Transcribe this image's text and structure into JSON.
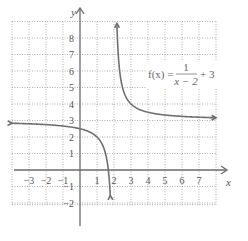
{
  "chart_data": {
    "type": "line",
    "title": "",
    "xlabel": "x",
    "ylabel": "y",
    "xlim": [
      -4,
      8
    ],
    "ylim": [
      -2.5,
      9
    ],
    "grid": true,
    "x_ticks": [
      -3,
      -2,
      -1,
      1,
      2,
      3,
      4,
      5,
      6,
      7
    ],
    "x_tick_labels": [
      "−3",
      "−2",
      "−1",
      "1",
      "2",
      "3",
      "4",
      "5",
      "6",
      "7"
    ],
    "y_ticks": [
      8,
      7,
      6,
      5,
      4,
      3,
      2,
      1,
      -1,
      -2
    ],
    "y_tick_labels": [
      "8",
      "7",
      "6",
      "5",
      "4",
      "3",
      "2",
      "1",
      "−1",
      "−2"
    ],
    "series": [
      {
        "name": "f(x) = 1/(x − 2) + 3",
        "function": "1/(x-2)+3",
        "vertical_asymptote": 2,
        "horizontal_asymptote": 3,
        "branches": [
          {
            "x_start": -4,
            "x_end": 1.78
          },
          {
            "x_start": 2.17,
            "x_end": 8
          }
        ],
        "sample_points": [
          {
            "x": -3,
            "y": 2.8
          },
          {
            "x": 0,
            "y": 2.5
          },
          {
            "x": 1,
            "y": 2
          },
          {
            "x": 1.5,
            "y": 1
          },
          {
            "x": 2.5,
            "y": 5
          },
          {
            "x": 3,
            "y": 4
          },
          {
            "x": 4,
            "y": 3.5
          },
          {
            "x": 7,
            "y": 3.2
          }
        ]
      }
    ],
    "annotation": {
      "lhs": "f(x) =",
      "numerator": "1",
      "denominator": "x − 2",
      "rhs": "+ 3"
    }
  }
}
